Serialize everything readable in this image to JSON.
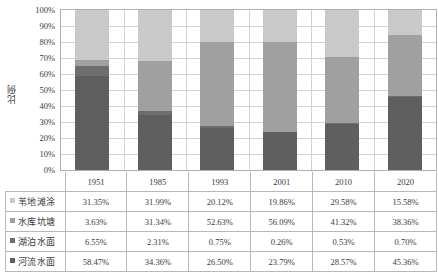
{
  "chart_data": {
    "type": "bar",
    "stacked": true,
    "normalized_percent": true,
    "title": "",
    "xlabel": "",
    "ylabel": "比例",
    "ylim": [
      0,
      100
    ],
    "ytick_labels": [
      "100%",
      "90%",
      "80%",
      "70%",
      "60%",
      "50%",
      "40%",
      "30%",
      "20%",
      "10%",
      "0%"
    ],
    "ytick_values": [
      100,
      90,
      80,
      70,
      60,
      50,
      40,
      30,
      20,
      10,
      0
    ],
    "grid": true,
    "legend_position": "table-left",
    "categories": [
      "1951",
      "1985",
      "1993",
      "2001",
      "2010",
      "2020"
    ],
    "stack_order_bottom_to_top": [
      "河流水面",
      "湖泊水面",
      "水库坑塘",
      "苇地滩涂"
    ],
    "series": [
      {
        "name": "苇地滩涂",
        "color": "#c9c9c9",
        "values": [
          31.35,
          31.99,
          20.12,
          19.86,
          29.58,
          15.58
        ],
        "labels": [
          "31.35%",
          "31.99%",
          "20.12%",
          "19.86%",
          "29.58%",
          "15.58%"
        ]
      },
      {
        "name": "水库坑塘",
        "color": "#a0a0a0",
        "values": [
          3.63,
          31.34,
          52.63,
          56.09,
          41.32,
          38.36
        ],
        "labels": [
          "3.63%",
          "31.34%",
          "52.63%",
          "56.09%",
          "41.32%",
          "38.36%"
        ]
      },
      {
        "name": "湖泊水面",
        "color": "#6e6e6e",
        "values": [
          6.55,
          2.31,
          0.75,
          0.26,
          0.53,
          0.7
        ],
        "labels": [
          "6.55%",
          "2.31%",
          "0.75%",
          "0.26%",
          "0.53%",
          "0.70%"
        ]
      },
      {
        "name": "河流水面",
        "color": "#5f5f5f",
        "values": [
          58.47,
          34.36,
          26.5,
          23.79,
          28.57,
          45.36
        ],
        "labels": [
          "58.47%",
          "34.36%",
          "26.50%",
          "23.79%",
          "28.57%",
          "45.36%"
        ]
      }
    ]
  },
  "axis": {
    "ylabel": "比例",
    "yticks": [
      "100%",
      "90%",
      "80%",
      "70%",
      "60%",
      "50%",
      "40%",
      "30%",
      "20%",
      "10%",
      "0%"
    ]
  },
  "data_table": {
    "year_row": [
      "1951",
      "1985",
      "1993",
      "2001",
      "2010",
      "2020"
    ],
    "rows": [
      {
        "label": "苇地滩涂",
        "color": "#c9c9c9",
        "cells": [
          "31.35%",
          "31.99%",
          "20.12%",
          "19.86%",
          "29.58%",
          "15.58%"
        ]
      },
      {
        "label": "水库坑塘",
        "color": "#a0a0a0",
        "cells": [
          "3.63%",
          "31.34%",
          "52.63%",
          "56.09%",
          "41.32%",
          "38.36%"
        ]
      },
      {
        "label": "湖泊水面",
        "color": "#6e6e6e",
        "cells": [
          "6.55%",
          "2.31%",
          "0.75%",
          "0.26%",
          "0.53%",
          "0.70%"
        ]
      },
      {
        "label": "河流水面",
        "color": "#5f5f5f",
        "cells": [
          "58.47%",
          "34.36%",
          "26.50%",
          "23.79%",
          "28.57%",
          "45.36%"
        ]
      }
    ]
  },
  "colors": {
    "reed_flat": "#c9c9c9",
    "reservoir_pond": "#a0a0a0",
    "lake_surface": "#6e6e6e",
    "river_surface": "#5f5f5f",
    "gridline": "#d2d2d2",
    "border": "#b0b0b0",
    "text": "#3a3a3a"
  }
}
